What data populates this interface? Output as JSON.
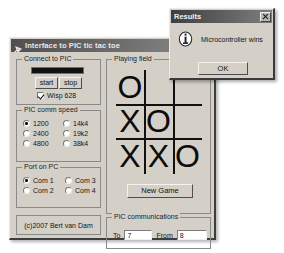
{
  "main_window": {
    "title": "Interface to PIC tic tac toe",
    "icon": "app-pin-icon",
    "titlebar_buttons": [
      {
        "name": "minimize-button",
        "glyph": "minimize"
      },
      {
        "name": "maximize-button",
        "glyph": "maximize"
      }
    ],
    "connect_group": {
      "legend": "Connect to PIC",
      "status_bar_value": "",
      "start_label": "start",
      "stop_label": "stop",
      "wisp_checkbox_label": "Wisp 628",
      "wisp_checked": true
    },
    "comm_speed_group": {
      "legend": "PIC comm speed",
      "options": [
        {
          "label": "1200",
          "selected": true
        },
        {
          "label": "14k4",
          "selected": false
        },
        {
          "label": "2400",
          "selected": false
        },
        {
          "label": "19k2",
          "selected": false
        },
        {
          "label": "4800",
          "selected": false
        },
        {
          "label": "38k4",
          "selected": false
        }
      ]
    },
    "port_group": {
      "legend": "Port on PC",
      "options": [
        {
          "label": "Com 1",
          "selected": true
        },
        {
          "label": "Com 3",
          "selected": false
        },
        {
          "label": "Com 2",
          "selected": false
        },
        {
          "label": "Com 4",
          "selected": false
        }
      ]
    },
    "credit": "(c)2007 Bert van Dam",
    "playing_field": {
      "legend": "Playing field",
      "cells": [
        "O",
        "",
        "",
        "X",
        "O",
        "",
        "X",
        "X",
        "O"
      ],
      "new_game_label": "New Game"
    },
    "communications_group": {
      "legend": "PIC communications",
      "to_label": "To",
      "to_value": "7",
      "from_label": "From",
      "from_value": "8"
    }
  },
  "dialog": {
    "title": "Results",
    "close_label": "close-icon",
    "icon": "info-icon",
    "message": "Microcontroller wins",
    "ok_label": "OK"
  },
  "colors": {
    "face": "#d4d0c8",
    "titlebar_dark": "#4f4f4f",
    "text": "#131313",
    "status_bar": "#121212"
  }
}
